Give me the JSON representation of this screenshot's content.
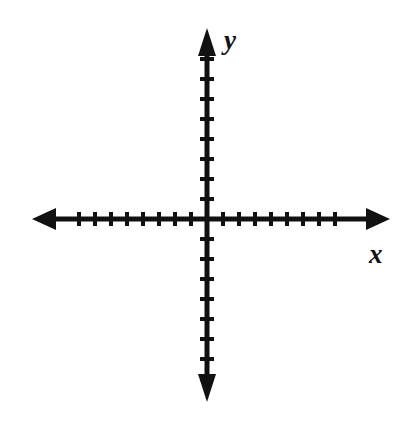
{
  "figure": {
    "name": "cartesian-coordinate-plane",
    "background_color": "#ffffff",
    "stroke_color": "#111111"
  },
  "labels": {
    "y_axis": "y",
    "x_axis": "x"
  },
  "chart_data": {
    "type": "scatter",
    "title": "",
    "subtitle": "",
    "xlabel": "x",
    "ylabel": "y",
    "grid": false,
    "legend": null,
    "series": [],
    "x": [],
    "values": [],
    "annotations": [],
    "xlim": [
      -8,
      8
    ],
    "ylim": [
      -8,
      8
    ],
    "x_tick_values": [
      -8,
      -7,
      -6,
      -5,
      -4,
      -3,
      -2,
      -1,
      1,
      2,
      3,
      4,
      5,
      6,
      7,
      8
    ],
    "y_tick_values": [
      -8,
      -7,
      -6,
      -5,
      -4,
      -3,
      -2,
      -1,
      1,
      2,
      3,
      4,
      5,
      6,
      7,
      8
    ],
    "x_tick_labels": [],
    "y_tick_labels": [],
    "x_ticks_per_side": 8,
    "y_ticks_per_side": 8,
    "axis_arrows": [
      "left",
      "right",
      "up",
      "down"
    ]
  },
  "geometry": {
    "origin_x": 207,
    "origin_y": 219,
    "x_axis_start": 32,
    "x_axis_end": 390,
    "y_axis_top": 28,
    "y_axis_bottom": 402,
    "x_tick_spacing": 16,
    "y_tick_spacing": 20,
    "x_tick_half_length": 7,
    "y_tick_half_length": 7,
    "axis_stroke_width": 5,
    "tick_stroke_width": 4
  }
}
